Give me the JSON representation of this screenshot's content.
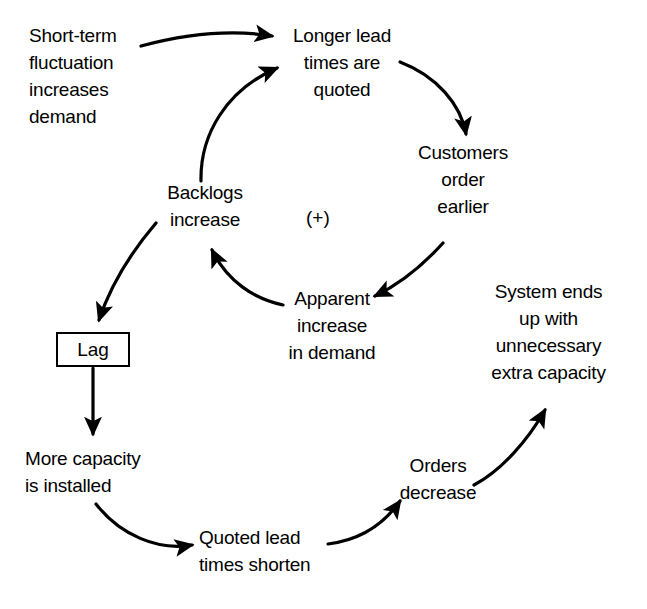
{
  "diagram": {
    "loop_sign": "(+)",
    "line_color": "#000000",
    "background_color": "#ffffff",
    "nodes": [
      {
        "id": "short-term-fluctuation",
        "label": "Short-term\nfluctuation\nincreases\ndemand"
      },
      {
        "id": "longer-lead-times-quoted",
        "label": "Longer lead\ntimes are\nquoted"
      },
      {
        "id": "customers-order-earlier",
        "label": "Customers\norder\nearlier"
      },
      {
        "id": "apparent-increase-in-demand",
        "label": "Apparent\nincrease\nin demand"
      },
      {
        "id": "backlogs-increase",
        "label": "Backlogs\nincrease"
      },
      {
        "id": "lag",
        "label": "Lag"
      },
      {
        "id": "more-capacity-installed",
        "label": "More capacity\nis installed"
      },
      {
        "id": "quoted-lead-times-shorten",
        "label": "Quoted lead\ntimes shorten"
      },
      {
        "id": "orders-decrease",
        "label": "Orders\ndecrease"
      },
      {
        "id": "system-extra-capacity",
        "label": "System ends\nup with\nunnecessary\nextra capacity"
      }
    ],
    "edges": [
      {
        "id": "short-term-to-longer-lead",
        "from": "short-term-fluctuation",
        "to": "longer-lead-times-quoted"
      },
      {
        "id": "longer-lead-to-customers",
        "from": "longer-lead-times-quoted",
        "to": "customers-order-earlier"
      },
      {
        "id": "customers-to-apparent",
        "from": "customers-order-earlier",
        "to": "apparent-increase-in-demand"
      },
      {
        "id": "apparent-to-backlogs",
        "from": "apparent-increase-in-demand",
        "to": "backlogs-increase"
      },
      {
        "id": "backlogs-to-longer-lead",
        "from": "backlogs-increase",
        "to": "longer-lead-times-quoted"
      },
      {
        "id": "backlogs-to-lag",
        "from": "backlogs-increase",
        "to": "lag"
      },
      {
        "id": "lag-to-more-capacity",
        "from": "lag",
        "to": "more-capacity-installed"
      },
      {
        "id": "more-capacity-to-quoted-lead",
        "from": "more-capacity-installed",
        "to": "quoted-lead-times-shorten"
      },
      {
        "id": "quoted-lead-to-orders",
        "from": "quoted-lead-times-shorten",
        "to": "orders-decrease"
      },
      {
        "id": "orders-to-system",
        "from": "orders-decrease",
        "to": "system-extra-capacity"
      }
    ]
  }
}
